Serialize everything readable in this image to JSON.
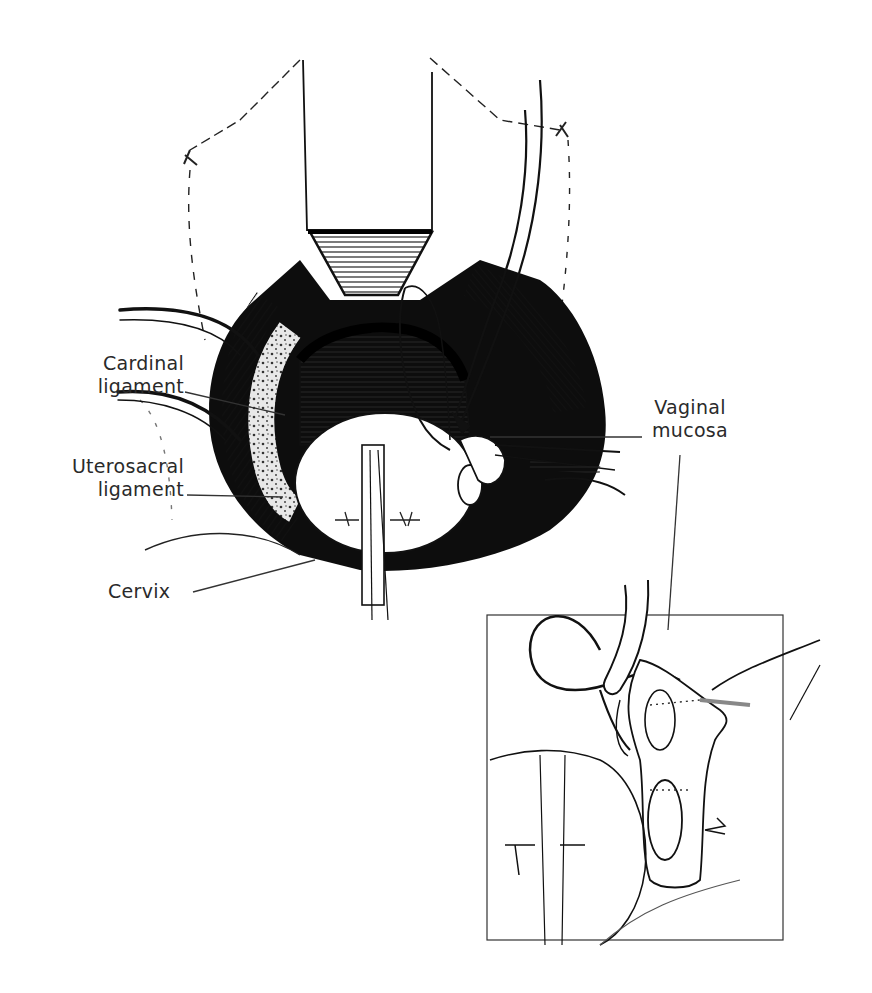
{
  "figure": {
    "type": "surgical anatomical illustration",
    "style": "black ink line drawing on white",
    "colors": {
      "ink": "#111111",
      "label": "#2a2a2a",
      "background": "#ffffff"
    },
    "labels": {
      "cardinal": {
        "line1": "Cardinal",
        "line2": "ligament"
      },
      "uterosacral": {
        "line1": "Uterosacral",
        "line2": "ligament"
      },
      "cervix": {
        "line1": "Cervix"
      },
      "vaginal": {
        "line1": "Vaginal",
        "line2": "mucosa"
      }
    },
    "inset": {
      "present": true,
      "description": "enlarged detail view of suture placement"
    }
  }
}
